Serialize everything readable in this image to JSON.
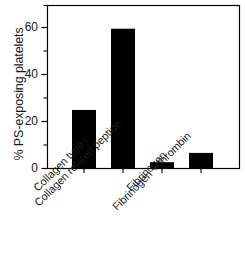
{
  "chart_data": {
    "type": "bar",
    "title": "",
    "xlabel": "",
    "ylabel": "% PS-exposing platelets",
    "categories": [
      "Collagen type I",
      "Collagen related peptide",
      "Fibrinogen",
      "Fibrinogen + thrombin"
    ],
    "values": [
      25,
      60,
      2.5,
      6.5
    ],
    "ylim": [
      0,
      70
    ],
    "yticks": [
      0,
      20,
      40,
      60
    ],
    "ytick_labels": [
      "0",
      "20",
      "40",
      "60"
    ],
    "yminor_ticks": [
      10,
      30,
      50,
      70
    ],
    "grid": false,
    "legend": null,
    "bar_color": "#000000",
    "axis_color": "#000000",
    "background": "#ffffff"
  },
  "axes": {
    "ylabel": "% PS-exposing platelets",
    "ytick_0": "0",
    "ytick_1": "20",
    "ytick_2": "40",
    "ytick_3": "60",
    "xtick_0": "Collagen type I",
    "xtick_1": "Collagen related peptide",
    "xtick_2": "Fibrinogen",
    "xtick_3": "Fibrinogen + thrombin"
  }
}
